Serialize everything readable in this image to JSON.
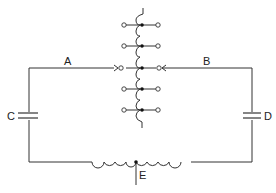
{
  "diagram": {
    "type": "circuit",
    "labels": {
      "A": "A",
      "B": "B",
      "C": "C",
      "D": "D",
      "E": "E"
    },
    "components": [
      {
        "id": "A",
        "kind": "wire-lead",
        "description": "left lead to tapped coil"
      },
      {
        "id": "B",
        "kind": "wire-lead",
        "description": "right lead to tapped coil"
      },
      {
        "id": "C",
        "kind": "capacitor",
        "position": "left branch"
      },
      {
        "id": "D",
        "kind": "capacitor",
        "position": "right branch"
      },
      {
        "id": "E",
        "kind": "center-tap",
        "position": "bottom inductor"
      }
    ],
    "tapped_coil": {
      "taps": 5
    },
    "colors": {
      "line": "#333333",
      "background": "#ffffff"
    }
  }
}
